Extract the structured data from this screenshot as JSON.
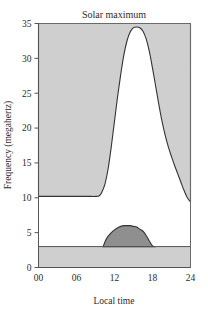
{
  "chart_data": {
    "type": "area",
    "title": "Solar maximum",
    "xlabel": "Local time",
    "ylabel": "Frequency (megahertz)",
    "xlim": [
      0,
      24
    ],
    "ylim": [
      0,
      35
    ],
    "xticks": [
      "00",
      "06",
      "12",
      "18",
      "24"
    ],
    "xtick_values": [
      0,
      6,
      12,
      18,
      24
    ],
    "yticks": [
      "0",
      "5",
      "10",
      "15",
      "20",
      "25",
      "30",
      "35"
    ],
    "ytick_values": [
      0,
      5,
      10,
      15,
      20,
      25,
      30,
      35
    ],
    "grid": false,
    "legend": null,
    "series": [
      {
        "name": "Maximum usable frequency",
        "fill": "#cfcfcf",
        "line_color": "#333333",
        "description": "Shaded region above the curve (unusable / reflected band)",
        "x": [
          0,
          1,
          2,
          3,
          4,
          5,
          6,
          7,
          8,
          9,
          9.6,
          10,
          10.5,
          11,
          11.5,
          12,
          12.5,
          13,
          13.5,
          14,
          14.5,
          15,
          15.5,
          16,
          16.5,
          17,
          17.5,
          18,
          18.5,
          19,
          19.5,
          20,
          20.5,
          21,
          21.5,
          22,
          22.5,
          23,
          23.5,
          24
        ],
        "y": [
          10.2,
          10.2,
          10.2,
          10.2,
          10.2,
          10.2,
          10.2,
          10.2,
          10.2,
          10.2,
          10.3,
          10.8,
          12.0,
          14.2,
          17.4,
          21.0,
          24.6,
          27.8,
          30.6,
          32.6,
          33.8,
          34.4,
          34.5,
          34.4,
          33.9,
          32.8,
          31.0,
          28.6,
          26.0,
          23.4,
          21.0,
          19.0,
          17.3,
          15.9,
          14.6,
          13.4,
          12.2,
          11.0,
          10.0,
          9.4
        ]
      },
      {
        "name": "Lowest usable frequency",
        "fill": "#8f8f8f",
        "line_color": "#333333",
        "description": "Dark dome over the daytime hours, peaking near 6 MHz",
        "x": [
          10.2,
          10.6,
          11,
          11.5,
          12,
          12.5,
          13,
          13.5,
          14,
          14.5,
          15,
          15.5,
          16,
          16.5,
          17,
          17.5,
          18,
          18.2
        ],
        "y": [
          3.0,
          3.9,
          4.5,
          5.0,
          5.4,
          5.7,
          5.9,
          6.0,
          6.0,
          6.0,
          5.9,
          5.8,
          5.5,
          5.2,
          4.6,
          3.8,
          3.1,
          3.0
        ]
      },
      {
        "name": "Ground absorption band",
        "fill": "#cfcfcf",
        "line_color": "#333333",
        "description": "Light gray horizontal band from 0 to 3 MHz across all hours",
        "x": [
          0,
          24
        ],
        "y_low": 0,
        "y_high": 3.0
      }
    ]
  }
}
